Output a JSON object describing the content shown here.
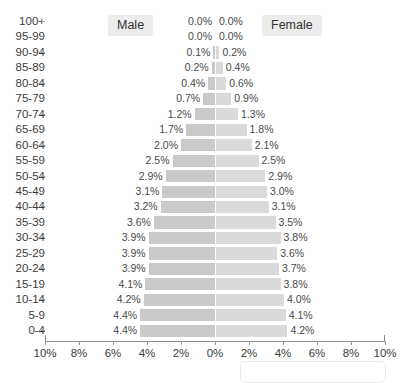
{
  "legend": {
    "male_label": "Male",
    "female_label": "Female"
  },
  "chart_data": {
    "type": "bar",
    "subtype": "population-pyramid",
    "title": "",
    "xlabel": "",
    "ylabel": "",
    "grid": false,
    "legend_position": "top",
    "orientation": "horizontal-diverging",
    "categories": [
      "100+",
      "95-99",
      "90-94",
      "85-89",
      "80-84",
      "75-79",
      "70-74",
      "65-69",
      "60-64",
      "55-59",
      "50-54",
      "45-49",
      "40-44",
      "35-39",
      "30-34",
      "25-29",
      "20-24",
      "15-19",
      "10-14",
      "5-9",
      "0-4"
    ],
    "series": [
      {
        "name": "Male",
        "color": "#c9c9c9",
        "side": "left",
        "values": [
          0.0,
          0.0,
          0.1,
          0.2,
          0.4,
          0.7,
          1.2,
          1.7,
          2.0,
          2.5,
          2.9,
          3.1,
          3.2,
          3.6,
          3.9,
          3.9,
          3.9,
          4.1,
          4.2,
          4.4,
          4.4
        ],
        "labels": [
          "0.0%",
          "0.0%",
          "0.1%",
          "0.2%",
          "0.4%",
          "0.7%",
          "1.2%",
          "1.7%",
          "2.0%",
          "2.5%",
          "2.9%",
          "3.1%",
          "3.2%",
          "3.6%",
          "3.9%",
          "3.9%",
          "3.9%",
          "4.1%",
          "4.2%",
          "4.4%",
          "4.4%"
        ]
      },
      {
        "name": "Female",
        "color": "#dadada",
        "side": "right",
        "values": [
          0.0,
          0.0,
          0.2,
          0.4,
          0.6,
          0.9,
          1.3,
          1.8,
          2.1,
          2.5,
          2.9,
          3.0,
          3.1,
          3.5,
          3.8,
          3.6,
          3.7,
          3.8,
          4.0,
          4.1,
          4.2
        ],
        "labels": [
          "0.0%",
          "0.0%",
          "0.2%",
          "0.4%",
          "0.6%",
          "0.9%",
          "1.3%",
          "1.8%",
          "2.1%",
          "2.5%",
          "2.9%",
          "3.0%",
          "3.1%",
          "3.5%",
          "3.8%",
          "3.6%",
          "3.7%",
          "3.8%",
          "4.0%",
          "4.1%",
          "4.2%"
        ]
      }
    ],
    "xlim": [
      10,
      0,
      10
    ],
    "xticks_left": [
      "10%",
      "8%",
      "6%",
      "4%",
      "2%"
    ],
    "xtick_center": "0%",
    "xticks_right": [
      "2%",
      "4%",
      "6%",
      "8%",
      "10%"
    ],
    "xtick_values_left": [
      10,
      8,
      6,
      4,
      2
    ],
    "xtick_values_right": [
      2,
      4,
      6,
      8,
      10
    ]
  }
}
